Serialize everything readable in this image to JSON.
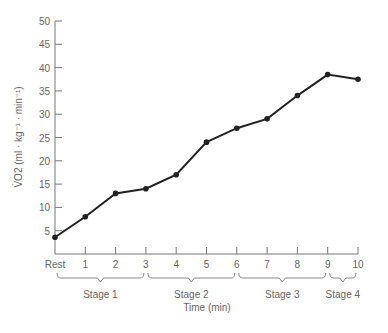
{
  "chart_data": {
    "type": "line",
    "title": "",
    "xlabel": "Time (min)",
    "ylabel": "V̇O2 (ml · kg⁻¹ · min⁻¹)",
    "x": [
      "Rest",
      "1",
      "2",
      "3",
      "4",
      "5",
      "6",
      "7",
      "8",
      "9",
      "10"
    ],
    "series": [
      {
        "name": "VO2",
        "values": [
          3.6,
          8,
          13,
          14,
          17,
          24,
          27,
          29,
          34,
          38.5,
          37.5
        ]
      }
    ],
    "yticks": [
      5,
      10,
      15,
      20,
      25,
      30,
      35,
      40,
      45,
      50
    ],
    "ylim": [
      0,
      50
    ],
    "grid": false,
    "stages": [
      {
        "label": "Stage 1",
        "from": 0,
        "to": 3
      },
      {
        "label": "Stage 2",
        "from": 3,
        "to": 6
      },
      {
        "label": "Stage 3",
        "from": 6,
        "to": 9
      },
      {
        "label": "Stage 4",
        "from": 9,
        "to": 10
      }
    ]
  }
}
